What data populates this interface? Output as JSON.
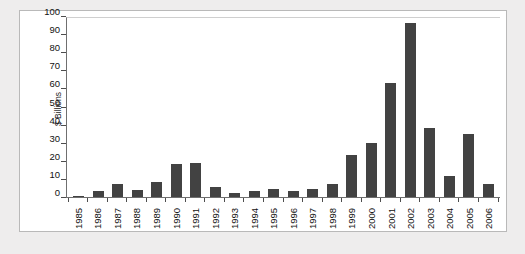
{
  "chart_data": {
    "type": "bar",
    "title": "",
    "subtitle": "",
    "xlabel": "",
    "ylabel": "$ Billions",
    "ylim": [
      0,
      100
    ],
    "ytick_step": 10,
    "yticks": [
      100,
      90,
      80,
      70,
      60,
      50,
      40,
      30,
      20,
      10,
      0
    ],
    "grid": false,
    "legend": null,
    "legend_position": "none",
    "bar_color": "#424242",
    "categories": [
      "1985",
      "1986",
      "1987",
      "1988",
      "1989",
      "1990",
      "1991",
      "1992",
      "1993",
      "1994",
      "1995",
      "1996",
      "1997",
      "1998",
      "1999",
      "2000",
      "2001",
      "2002",
      "2003",
      "2004",
      "2005",
      "2006"
    ],
    "values": [
      0.6,
      3.2,
      7.3,
      4.0,
      8.2,
      18.2,
      18.8,
      5.6,
      2.4,
      3.4,
      4.6,
      3.3,
      4.3,
      7.4,
      23.5,
      30.4,
      63.6,
      97.0,
      38.4,
      11.6,
      35.4,
      7.5
    ],
    "series": [
      {
        "name": "$ Billions",
        "values": [
          0.6,
          3.2,
          7.3,
          4.0,
          8.2,
          18.2,
          18.8,
          5.6,
          2.4,
          3.4,
          4.6,
          3.3,
          4.3,
          7.4,
          23.5,
          30.4,
          63.6,
          97.0,
          38.4,
          11.6,
          35.4,
          7.5
        ]
      }
    ],
    "annotations": []
  },
  "figure": {
    "panel_background": "#ffffff",
    "page_background": "#eeeded",
    "caption": ""
  }
}
